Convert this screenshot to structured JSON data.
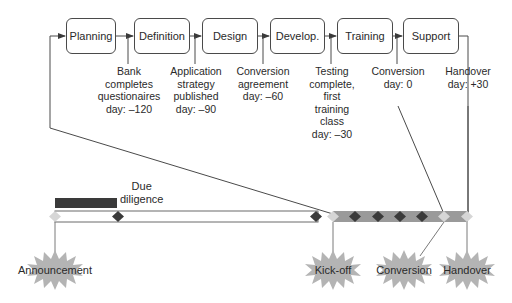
{
  "phases": [
    {
      "label": "Planning"
    },
    {
      "label": "Definition"
    },
    {
      "label": "Design"
    },
    {
      "label": "Develop."
    },
    {
      "label": "Training"
    },
    {
      "label": "Support"
    }
  ],
  "milestones": [
    {
      "text": "Bank\ncompletes\nquestionaires\nday: –120",
      "day": -120
    },
    {
      "text": "Application\nstrategy\npublished\nday: –90",
      "day": -90
    },
    {
      "text": "Conversion\nagreement\nday: –60",
      "day": -60
    },
    {
      "text": "Testing\ncomplete,\nfirst\ntraining\nclass\nday: –30",
      "day": -30
    },
    {
      "text": "Conversion\nday: 0",
      "day": 0
    },
    {
      "text": "Handover\nday: +30",
      "day": 30
    }
  ],
  "timeline": {
    "due_diligence_label": "Due\ndiligence",
    "events": [
      {
        "label": "Announcement"
      },
      {
        "label": "Kick-off"
      },
      {
        "label": "Conversion"
      },
      {
        "label": "Handover"
      }
    ]
  },
  "colors": {
    "line": "#4a4a4a",
    "dark_bar": "#3a3a3a",
    "grey_bar": "#9a9a9a",
    "dark_diamond": "#3a3a3a",
    "light_diamond": "#d6d6d6",
    "burst": "#b4b4b4"
  }
}
